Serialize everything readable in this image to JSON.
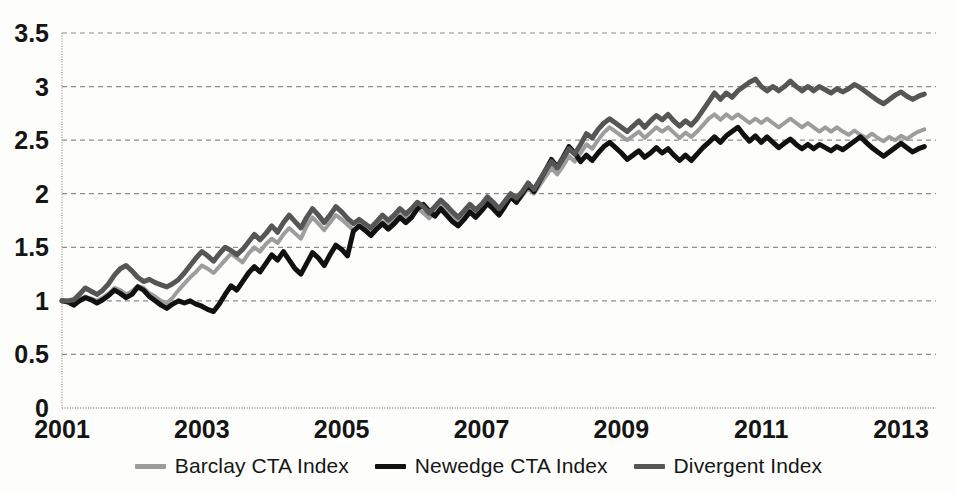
{
  "chart_data": {
    "type": "line",
    "title": "",
    "subtitle": "",
    "xlabel": "",
    "ylabel": "",
    "xlim": [
      2001,
      2013.5
    ],
    "ylim": [
      0,
      3.5
    ],
    "yticks": [
      "0",
      "0.5",
      "1",
      "1.5",
      "2",
      "2.5",
      "3",
      "3.5"
    ],
    "ytick_values": [
      0,
      0.5,
      1,
      1.5,
      2,
      2.5,
      3,
      3.5
    ],
    "xticks": [
      "2001",
      "2003",
      "2005",
      "2007",
      "2009",
      "2011",
      "2013"
    ],
    "xtick_values": [
      2001,
      2003,
      2005,
      2007,
      2009,
      2011,
      2013
    ],
    "grid": true,
    "grid_axis": "y",
    "grid_style": "dashed",
    "legend_position": "bottom",
    "x": [
      2001.0,
      2001.083,
      2001.167,
      2001.25,
      2001.333,
      2001.417,
      2001.5,
      2001.583,
      2001.667,
      2001.75,
      2001.833,
      2001.917,
      2002.0,
      2002.083,
      2002.167,
      2002.25,
      2002.333,
      2002.417,
      2002.5,
      2002.583,
      2002.667,
      2002.75,
      2002.833,
      2002.917,
      2003.0,
      2003.083,
      2003.167,
      2003.25,
      2003.333,
      2003.417,
      2003.5,
      2003.583,
      2003.667,
      2003.75,
      2003.833,
      2003.917,
      2004.0,
      2004.083,
      2004.167,
      2004.25,
      2004.333,
      2004.417,
      2004.5,
      2004.583,
      2004.667,
      2004.75,
      2004.833,
      2004.917,
      2005.0,
      2005.083,
      2005.167,
      2005.25,
      2005.333,
      2005.417,
      2005.5,
      2005.583,
      2005.667,
      2005.75,
      2005.833,
      2005.917,
      2006.0,
      2006.083,
      2006.167,
      2006.25,
      2006.333,
      2006.417,
      2006.5,
      2006.583,
      2006.667,
      2006.75,
      2006.833,
      2006.917,
      2007.0,
      2007.083,
      2007.167,
      2007.25,
      2007.333,
      2007.417,
      2007.5,
      2007.583,
      2007.667,
      2007.75,
      2007.833,
      2007.917,
      2008.0,
      2008.083,
      2008.167,
      2008.25,
      2008.333,
      2008.417,
      2008.5,
      2008.583,
      2008.667,
      2008.75,
      2008.833,
      2008.917,
      2009.0,
      2009.083,
      2009.167,
      2009.25,
      2009.333,
      2009.417,
      2009.5,
      2009.583,
      2009.667,
      2009.75,
      2009.833,
      2009.917,
      2010.0,
      2010.083,
      2010.167,
      2010.25,
      2010.333,
      2010.417,
      2010.5,
      2010.583,
      2010.667,
      2010.75,
      2010.833,
      2010.917,
      2011.0,
      2011.083,
      2011.167,
      2011.25,
      2011.333,
      2011.417,
      2011.5,
      2011.583,
      2011.667,
      2011.75,
      2011.833,
      2011.917,
      2012.0,
      2012.083,
      2012.167,
      2012.25,
      2012.333,
      2012.417,
      2012.5,
      2012.583,
      2012.667,
      2012.75,
      2012.833,
      2012.917,
      2013.0,
      2013.083,
      2013.167,
      2013.25,
      2013.333
    ],
    "series": [
      {
        "name": "Barclay CTA Index",
        "color": "#9d9d9d",
        "width": 4,
        "values": [
          1.0,
          0.99,
          0.97,
          1.01,
          1.04,
          1.02,
          1.0,
          1.03,
          1.07,
          1.12,
          1.1,
          1.06,
          1.09,
          1.14,
          1.12,
          1.07,
          1.04,
          1.0,
          0.98,
          1.03,
          1.1,
          1.16,
          1.22,
          1.27,
          1.33,
          1.3,
          1.26,
          1.32,
          1.38,
          1.44,
          1.4,
          1.36,
          1.44,
          1.5,
          1.46,
          1.53,
          1.58,
          1.54,
          1.62,
          1.68,
          1.63,
          1.58,
          1.7,
          1.78,
          1.72,
          1.66,
          1.73,
          1.8,
          1.76,
          1.71,
          1.66,
          1.7,
          1.67,
          1.63,
          1.69,
          1.74,
          1.7,
          1.75,
          1.8,
          1.76,
          1.8,
          1.86,
          1.82,
          1.77,
          1.83,
          1.89,
          1.84,
          1.79,
          1.74,
          1.79,
          1.85,
          1.81,
          1.86,
          1.92,
          1.87,
          1.82,
          1.89,
          1.96,
          1.92,
          1.98,
          2.05,
          2.0,
          2.08,
          2.16,
          2.24,
          2.18,
          2.26,
          2.35,
          2.3,
          2.38,
          2.46,
          2.42,
          2.5,
          2.57,
          2.62,
          2.58,
          2.54,
          2.5,
          2.54,
          2.58,
          2.52,
          2.57,
          2.62,
          2.58,
          2.62,
          2.57,
          2.52,
          2.57,
          2.53,
          2.58,
          2.64,
          2.7,
          2.74,
          2.69,
          2.74,
          2.7,
          2.74,
          2.7,
          2.66,
          2.7,
          2.66,
          2.7,
          2.66,
          2.62,
          2.66,
          2.7,
          2.66,
          2.62,
          2.66,
          2.62,
          2.58,
          2.62,
          2.58,
          2.62,
          2.58,
          2.55,
          2.59,
          2.55,
          2.52,
          2.56,
          2.52,
          2.49,
          2.53,
          2.5,
          2.54,
          2.51,
          2.55,
          2.58,
          2.6
        ]
      },
      {
        "name": "Newedge CTA Index",
        "color": "#111111",
        "width": 5,
        "values": [
          1.0,
          0.99,
          0.96,
          1.0,
          1.03,
          1.01,
          0.98,
          1.01,
          1.05,
          1.1,
          1.07,
          1.03,
          1.06,
          1.13,
          1.1,
          1.04,
          1.0,
          0.96,
          0.93,
          0.97,
          1.0,
          0.98,
          1.0,
          0.97,
          0.95,
          0.92,
          0.9,
          0.97,
          1.06,
          1.14,
          1.1,
          1.18,
          1.26,
          1.32,
          1.27,
          1.35,
          1.43,
          1.38,
          1.46,
          1.38,
          1.3,
          1.25,
          1.35,
          1.45,
          1.4,
          1.33,
          1.43,
          1.52,
          1.48,
          1.42,
          1.65,
          1.7,
          1.66,
          1.61,
          1.67,
          1.72,
          1.67,
          1.72,
          1.78,
          1.73,
          1.78,
          1.86,
          1.9,
          1.84,
          1.79,
          1.86,
          1.8,
          1.74,
          1.7,
          1.76,
          1.83,
          1.78,
          1.84,
          1.91,
          1.86,
          1.8,
          1.88,
          1.97,
          1.92,
          2.0,
          2.08,
          2.02,
          2.12,
          2.22,
          2.32,
          2.25,
          2.34,
          2.44,
          2.38,
          2.3,
          2.36,
          2.31,
          2.38,
          2.44,
          2.48,
          2.43,
          2.38,
          2.32,
          2.36,
          2.4,
          2.34,
          2.38,
          2.43,
          2.38,
          2.42,
          2.36,
          2.31,
          2.36,
          2.31,
          2.37,
          2.43,
          2.48,
          2.53,
          2.48,
          2.54,
          2.58,
          2.62,
          2.55,
          2.49,
          2.54,
          2.48,
          2.53,
          2.48,
          2.43,
          2.47,
          2.51,
          2.46,
          2.42,
          2.46,
          2.42,
          2.46,
          2.43,
          2.4,
          2.44,
          2.41,
          2.45,
          2.49,
          2.53,
          2.48,
          2.43,
          2.39,
          2.35,
          2.39,
          2.43,
          2.47,
          2.43,
          2.39,
          2.42,
          2.44
        ]
      },
      {
        "name": "Divergent Index",
        "color": "#565656",
        "width": 5,
        "values": [
          1.0,
          1.0,
          1.01,
          1.06,
          1.12,
          1.09,
          1.06,
          1.1,
          1.16,
          1.24,
          1.3,
          1.33,
          1.28,
          1.22,
          1.18,
          1.2,
          1.17,
          1.15,
          1.13,
          1.16,
          1.2,
          1.26,
          1.33,
          1.4,
          1.46,
          1.42,
          1.37,
          1.44,
          1.5,
          1.47,
          1.43,
          1.48,
          1.55,
          1.62,
          1.57,
          1.63,
          1.7,
          1.64,
          1.73,
          1.8,
          1.74,
          1.68,
          1.78,
          1.86,
          1.8,
          1.73,
          1.8,
          1.88,
          1.83,
          1.77,
          1.72,
          1.76,
          1.72,
          1.68,
          1.74,
          1.8,
          1.75,
          1.8,
          1.86,
          1.81,
          1.86,
          1.92,
          1.88,
          1.82,
          1.88,
          1.94,
          1.89,
          1.83,
          1.78,
          1.84,
          1.9,
          1.85,
          1.9,
          1.97,
          1.92,
          1.86,
          1.93,
          2.0,
          1.96,
          2.02,
          2.1,
          2.04,
          2.13,
          2.22,
          2.3,
          2.24,
          2.33,
          2.42,
          2.37,
          2.46,
          2.56,
          2.52,
          2.6,
          2.66,
          2.7,
          2.66,
          2.62,
          2.58,
          2.63,
          2.68,
          2.62,
          2.68,
          2.73,
          2.69,
          2.74,
          2.68,
          2.63,
          2.68,
          2.64,
          2.7,
          2.78,
          2.86,
          2.94,
          2.88,
          2.94,
          2.9,
          2.96,
          3.0,
          3.04,
          3.07,
          3.0,
          2.96,
          3.0,
          2.96,
          3.0,
          3.05,
          3.0,
          2.96,
          3.0,
          2.96,
          3.0,
          2.97,
          2.94,
          2.98,
          2.95,
          2.98,
          3.02,
          2.99,
          2.95,
          2.91,
          2.87,
          2.84,
          2.88,
          2.92,
          2.95,
          2.91,
          2.88,
          2.91,
          2.93
        ]
      }
    ]
  },
  "legend": {
    "items": [
      {
        "label": "Barclay CTA Index",
        "color": "#9d9d9d"
      },
      {
        "label": "Newedge CTA Index",
        "color": "#111111"
      },
      {
        "label": "Divergent Index",
        "color": "#565656"
      }
    ]
  },
  "axes": {
    "grid_color": "#8e8e8e",
    "spine_color": "#8e8e8e",
    "tick_label_color": "#151515"
  }
}
